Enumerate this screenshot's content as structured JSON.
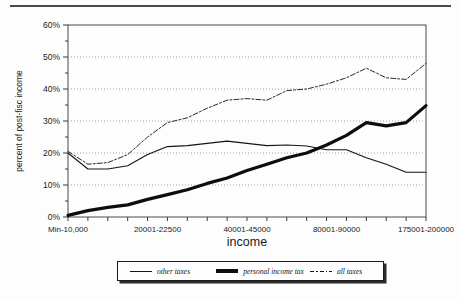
{
  "page": {
    "divider_name": "top-horizontal-rule"
  },
  "chart_data": {
    "type": "line",
    "title": "",
    "xlabel": "income",
    "ylabel": "percent of post-fisc income",
    "ylim": [
      0,
      60
    ],
    "ytick_labels": [
      "0%",
      "10%",
      "20%",
      "30%",
      "40%",
      "50%",
      "60%"
    ],
    "ytick_values": [
      0,
      10,
      20,
      30,
      40,
      50,
      60
    ],
    "grid": true,
    "legend_position": "bottom",
    "x_tick_count": 19,
    "xtick_labels": [
      "Min-10,000",
      "20001-22500",
      "40001-45000",
      "80001-90000",
      "175001-200000"
    ],
    "xtick_label_positions": [
      0,
      4.5,
      9,
      13.5,
      18
    ],
    "categories": [
      "Min-10,000",
      "10001-15000",
      "15001-20000",
      "20001-22500",
      "22501-25000",
      "25001-30000",
      "30001-35000",
      "35001-40000",
      "40001-45000",
      "45001-50000",
      "50001-60000",
      "60001-70000",
      "70001-80000",
      "80001-90000",
      "90001-100000",
      "100001-125000",
      "125001-150000",
      "150001-175000",
      "175001-200000"
    ],
    "series": [
      {
        "name": "other taxes",
        "style": "thin-solid",
        "color": "#141414",
        "values": [
          20.0,
          15.0,
          15.0,
          16.0,
          19.5,
          22.0,
          22.3,
          23.0,
          23.7,
          23.0,
          22.3,
          22.5,
          22.2,
          21.0,
          21.0,
          18.5,
          16.5,
          14.0,
          14.0
        ]
      },
      {
        "name": "personal income tax",
        "style": "thick-solid",
        "color": "#0d0d0d",
        "values": [
          0.5,
          2.0,
          3.0,
          3.8,
          5.5,
          7.0,
          8.5,
          10.5,
          12.2,
          14.5,
          16.5,
          18.5,
          20.0,
          22.5,
          25.5,
          29.5,
          28.5,
          29.5,
          34.8
        ]
      },
      {
        "name": "all taxes",
        "style": "dashed",
        "color": "#2a2a2a",
        "values": [
          20.5,
          16.5,
          17.0,
          19.5,
          25.0,
          29.5,
          31.0,
          34.0,
          36.5,
          37.0,
          36.5,
          39.5,
          40.0,
          41.5,
          43.5,
          46.5,
          43.5,
          43.0,
          48.0
        ]
      }
    ]
  },
  "legend": {
    "items": [
      {
        "label": "other taxes",
        "swatch": "thin-line-swatch"
      },
      {
        "label": "personal income tax",
        "swatch": "thick-line-swatch"
      },
      {
        "label": "all taxes",
        "swatch": "dashed-line-swatch"
      }
    ]
  }
}
